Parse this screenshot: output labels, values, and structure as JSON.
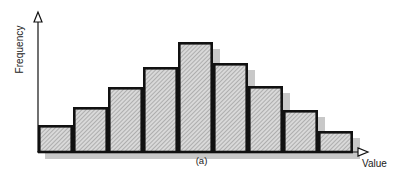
{
  "figure": {
    "panel_label": "(a)",
    "background": "#ffffff",
    "ink_color": "#111111",
    "bar_fill": "#d9d9d9",
    "bar_hatch": "#8a8a8a",
    "shadow_color": "#c8c8c8",
    "axis_arrow": "hollow-triangle"
  },
  "axes": {
    "y": {
      "label": "Frequency",
      "arrow": true,
      "ticks": [],
      "x_px": 38,
      "top_px": 12,
      "bottom_px": 152
    },
    "x": {
      "label": "Value",
      "arrow": true,
      "ticks": [],
      "y_px": 152,
      "left_px": 38,
      "right_px": 368
    }
  },
  "chart_data": {
    "type": "bar",
    "title": "",
    "subtitle": "",
    "xlabel": "Value",
    "ylabel": "Frequency",
    "panel": "(a)",
    "grid": false,
    "legend": null,
    "axis_ticks_shown": false,
    "note": "Unlabeled schematic histogram: bell-shaped (approximately normal) frequency distribution with nine equal-width bins.",
    "categories": [
      "1",
      "2",
      "3",
      "4",
      "5",
      "6",
      "7",
      "8",
      "9"
    ],
    "values": [
      27,
      45,
      65,
      85,
      110,
      89,
      66,
      42,
      21
    ],
    "xlim": [
      0,
      9
    ],
    "ylim": [
      0,
      140
    ],
    "series": [
      {
        "name": "Frequency",
        "values": [
          27,
          45,
          65,
          85,
          110,
          89,
          66,
          42,
          21
        ]
      }
    ],
    "bar_geometry_px": {
      "baseline_y": 152,
      "left_x": 38,
      "bar_width": 35,
      "tops_y": [
        125,
        107,
        87,
        67,
        42,
        63,
        86,
        110,
        131
      ],
      "shadow_offset_x": 7,
      "shadow_offset_y": 7
    }
  }
}
